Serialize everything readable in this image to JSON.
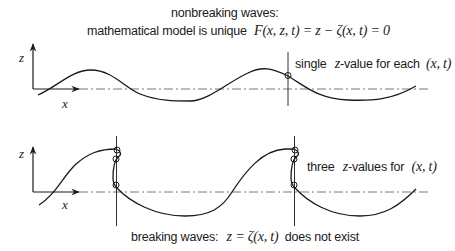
{
  "header": {
    "line1": "nonbreaking waves:",
    "line2_text": "mathematical model is unique",
    "line2_formula": "F(x, z, t) = z − ζ(x, t) = 0"
  },
  "top_panel": {
    "axis_z": "z",
    "axis_x": "x",
    "annotation_prefix": "single",
    "annotation_var": "z",
    "annotation_mid": "-value for each",
    "annotation_args": "(x, t)"
  },
  "bottom_panel": {
    "axis_z": "z",
    "axis_x": "x",
    "annotation_prefix": "three",
    "annotation_var": "z",
    "annotation_mid": "-values for",
    "annotation_args": "(x, t)"
  },
  "footer": {
    "text_prefix": "breaking waves:",
    "formula": "z = ζ(x, t)",
    "text_suffix": "does not exist"
  },
  "colors": {
    "stroke": "#1a1a1a",
    "background": "#ffffff"
  }
}
